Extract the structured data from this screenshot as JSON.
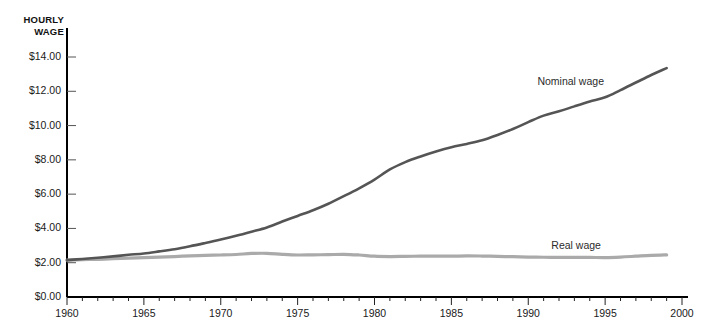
{
  "chart_data": {
    "type": "line",
    "title": "",
    "ylabel": "HOURLY WAGE",
    "xlabel": "",
    "xlim": [
      1960,
      2000
    ],
    "ylim": [
      0,
      14
    ],
    "grid": false,
    "legend_position": "inline-right",
    "x_tick_step": 1,
    "x_label_step": 5,
    "x_tick_labels": [
      "1960",
      "1965",
      "1970",
      "1975",
      "1980",
      "1985",
      "1990",
      "1995",
      "2000"
    ],
    "x_tick_label_values": [
      1960,
      1965,
      1970,
      1975,
      1980,
      1985,
      1990,
      1995,
      2000
    ],
    "y_tick_labels": [
      "$0.00",
      "$2.00",
      "$4.00",
      "$6.00",
      "$8.00",
      "$10.00",
      "$12.00",
      "$14.00"
    ],
    "y_tick_values": [
      0,
      2,
      4,
      6,
      8,
      10,
      12,
      14
    ],
    "x": [
      1960,
      1961,
      1962,
      1963,
      1964,
      1965,
      1966,
      1967,
      1968,
      1969,
      1970,
      1971,
      1972,
      1973,
      1974,
      1975,
      1976,
      1977,
      1978,
      1979,
      1980,
      1981,
      1982,
      1983,
      1984,
      1985,
      1986,
      1987,
      1988,
      1989,
      1990,
      1991,
      1992,
      1993,
      1994,
      1995,
      1996,
      1997,
      1998,
      1999
    ],
    "series": [
      {
        "name": "Nominal wage",
        "color": "#555555",
        "label_x": 1993.2,
        "label_y": 12.55,
        "values": [
          2.15,
          2.22,
          2.29,
          2.37,
          2.46,
          2.54,
          2.66,
          2.79,
          2.96,
          3.15,
          3.35,
          3.57,
          3.81,
          4.06,
          4.4,
          4.73,
          5.06,
          5.44,
          5.88,
          6.34,
          6.85,
          7.44,
          7.87,
          8.2,
          8.49,
          8.74,
          8.93,
          9.14,
          9.45,
          9.8,
          10.2,
          10.58,
          10.83,
          11.12,
          11.4,
          11.65,
          12.07,
          12.51,
          12.95,
          13.35
        ]
      },
      {
        "name": "Real wage",
        "color": "#aaaaaa",
        "label_x": 1991.5,
        "label_y": 2.97,
        "values": [
          2.15,
          2.18,
          2.2,
          2.23,
          2.27,
          2.3,
          2.33,
          2.36,
          2.4,
          2.43,
          2.45,
          2.48,
          2.54,
          2.55,
          2.49,
          2.45,
          2.46,
          2.47,
          2.49,
          2.45,
          2.38,
          2.36,
          2.37,
          2.38,
          2.38,
          2.38,
          2.4,
          2.39,
          2.37,
          2.35,
          2.33,
          2.32,
          2.31,
          2.31,
          2.31,
          2.3,
          2.33,
          2.38,
          2.43,
          2.46
        ]
      }
    ]
  },
  "axis": {
    "title_line1": "HOURLY",
    "title_line2": "WAGE"
  }
}
